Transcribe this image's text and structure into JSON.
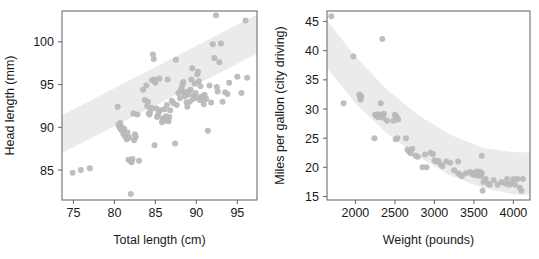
{
  "figure": {
    "background": "#ffffff",
    "point_color": "#b9b9b9",
    "band_color": "#ebebeb",
    "axis_color": "#6e6e6e",
    "text_color": "#1a1a1a"
  },
  "chart_data": [
    {
      "type": "scatter",
      "panel": "left",
      "title": "",
      "xlabel": "Total length (cm)",
      "ylabel": "Head length (mm)",
      "xlim": [
        73.6,
        97.4
      ],
      "ylim": [
        81.5,
        103.6
      ],
      "xticks": [
        75,
        80,
        85,
        90,
        95
      ],
      "yticks": [
        85,
        90,
        95,
        100
      ],
      "xticklabels": [
        "75",
        "80",
        "85",
        "90",
        "95"
      ],
      "yticklabels": [
        "85",
        "90",
        "95",
        "100"
      ],
      "grid": false,
      "legend": "none",
      "annotations": [
        "shaded prediction band rising left-to-right"
      ],
      "band": {
        "kind": "linear-prediction-band",
        "lower": [
          [
            73.6,
            87.0
          ],
          [
            97.4,
            98.6
          ]
        ],
        "upper": [
          [
            73.6,
            91.4
          ],
          [
            97.4,
            103.2
          ]
        ]
      },
      "x": [
        74.9,
        75.9,
        77.0,
        80.4,
        80.5,
        80.6,
        80.7,
        80.7,
        80.8,
        80.9,
        81.0,
        81.1,
        81.2,
        81.3,
        81.4,
        81.5,
        81.6,
        81.8,
        82.0,
        82.1,
        82.2,
        82.4,
        82.5,
        82.6,
        82.8,
        83.0,
        83.5,
        83.7,
        83.9,
        84.0,
        84.1,
        84.2,
        84.3,
        84.4,
        84.5,
        84.6,
        84.7,
        84.8,
        84.9,
        85.0,
        85.1,
        85.2,
        85.3,
        85.4,
        85.5,
        85.6,
        85.8,
        85.9,
        86.0,
        86.1,
        86.2,
        86.3,
        86.4,
        86.5,
        86.6,
        86.7,
        86.8,
        87.0,
        87.2,
        87.4,
        87.6,
        87.8,
        88.0,
        88.1,
        88.2,
        88.3,
        88.4,
        88.5,
        88.6,
        88.7,
        88.8,
        88.9,
        89.0,
        89.1,
        89.2,
        89.3,
        89.4,
        89.5,
        89.6,
        89.7,
        89.8,
        89.9,
        90.0,
        90.1,
        90.2,
        90.3,
        90.4,
        90.5,
        90.6,
        90.7,
        90.8,
        90.9,
        91.0,
        91.2,
        91.4,
        91.6,
        91.8,
        92.0,
        92.2,
        92.4,
        92.5,
        92.6,
        92.8,
        93.0,
        93.2,
        93.5,
        93.8,
        94.0,
        95.0,
        95.5,
        96.0,
        96.2,
        82.0,
        82.3,
        81.7,
        86.5,
        87.5,
        84.9
      ],
      "y": [
        84.7,
        85.0,
        85.2,
        92.4,
        90.3,
        90.1,
        89.9,
        90.5,
        89.7,
        90.0,
        89.6,
        89.2,
        89.8,
        89.0,
        88.9,
        88.6,
        89.4,
        88.8,
        86.0,
        85.9,
        86.3,
        88.5,
        89.2,
        88.9,
        91.5,
        86.1,
        94.4,
        93.2,
        94.9,
        92.5,
        93.0,
        91.6,
        91.5,
        91.9,
        92.3,
        95.5,
        98.5,
        98.0,
        95.6,
        95.2,
        92.2,
        91.2,
        91.4,
        91.8,
        95.7,
        92.0,
        90.6,
        90.9,
        91.1,
        92.1,
        90.8,
        91.3,
        92.6,
        91.0,
        90.7,
        91.2,
        92.0,
        93.1,
        92.8,
        88.1,
        92.6,
        94.0,
        93.4,
        94.3,
        94.6,
        95.0,
        95.3,
        93.9,
        93.6,
        94.1,
        92.9,
        92.4,
        93.8,
        94.2,
        93.0,
        94.4,
        95.6,
        96.9,
        93.3,
        93.7,
        95.1,
        94.0,
        93.5,
        96.2,
        96.5,
        95.4,
        93.2,
        94.8,
        93.6,
        93.4,
        93.1,
        92.7,
        93.8,
        93.3,
        89.6,
        94.9,
        92.9,
        99.7,
        98.1,
        103.1,
        94.7,
        94.2,
        97.6,
        99.8,
        93.0,
        94.1,
        93.9,
        95.2,
        95.9,
        94.0,
        102.5,
        95.8,
        82.2,
        91.6,
        86.2,
        95.6,
        97.9,
        87.9
      ]
    },
    {
      "type": "scatter",
      "panel": "right",
      "title": "",
      "xlabel": "Weight (pounds)",
      "ylabel": "Miles per gallon (city driving)",
      "xlim": [
        1640,
        4210
      ],
      "ylim": [
        14.4,
        46.8
      ],
      "xticks": [
        2000,
        2500,
        3000,
        3500,
        4000
      ],
      "yticks": [
        15,
        20,
        25,
        30,
        35,
        40,
        45
      ],
      "xticklabels": [
        "2000",
        "2500",
        "3000",
        "3500",
        "4000"
      ],
      "yticklabels": [
        "15",
        "20",
        "25",
        "30",
        "35",
        "40",
        "45"
      ],
      "grid": false,
      "legend": "none",
      "annotations": [
        "shaded curved prediction band decreasing left-to-right"
      ],
      "band": {
        "kind": "curved-prediction-band",
        "lower": [
          [
            1640,
            37.0
          ],
          [
            2000,
            31.0
          ],
          [
            2400,
            25.8
          ],
          [
            2800,
            21.8
          ],
          [
            3200,
            18.6
          ],
          [
            3600,
            16.5
          ],
          [
            4000,
            15.4
          ],
          [
            4210,
            15.2
          ]
        ],
        "upper": [
          [
            1640,
            45.2
          ],
          [
            2000,
            39.0
          ],
          [
            2400,
            33.3
          ],
          [
            2800,
            28.9
          ],
          [
            3200,
            25.6
          ],
          [
            3600,
            23.4
          ],
          [
            4000,
            22.6
          ],
          [
            4210,
            22.6
          ]
        ]
      },
      "x": [
        1695,
        1850,
        1975,
        2050,
        2060,
        2065,
        2075,
        2240,
        2250,
        2265,
        2280,
        2290,
        2300,
        2320,
        2340,
        2350,
        2360,
        2400,
        2480,
        2500,
        2510,
        2520,
        2530,
        2540,
        2640,
        2660,
        2680,
        2700,
        2720,
        2760,
        2790,
        2850,
        2880,
        2900,
        2950,
        2980,
        3000,
        3020,
        3050,
        3080,
        3100,
        3150,
        3200,
        3250,
        3300,
        3320,
        3350,
        3400,
        3450,
        3480,
        3500,
        3510,
        3520,
        3530,
        3540,
        3550,
        3560,
        3570,
        3580,
        3590,
        3600,
        3610,
        3620,
        3650,
        3680,
        3700,
        3750,
        3800,
        3850,
        3900,
        3920,
        3950,
        3980,
        4000,
        4020,
        4050,
        4080,
        4100,
        4120,
        2350,
        2300,
        3300,
        3600
      ],
      "y": [
        45.9,
        31.0,
        39.0,
        32.5,
        32.0,
        31.6,
        32.2,
        25.0,
        29.0,
        28.8,
        29.1,
        28.6,
        29.0,
        31.0,
        42.0,
        28.5,
        29.2,
        28.0,
        28.0,
        29.0,
        24.8,
        28.7,
        25.0,
        28.2,
        25.0,
        23.0,
        22.7,
        22.4,
        23.2,
        22.0,
        21.8,
        20.0,
        22.2,
        20.0,
        22.5,
        22.3,
        21.2,
        21.0,
        21.1,
        20.5,
        20.2,
        21.0,
        20.8,
        19.5,
        19.0,
        18.8,
        18.5,
        19.0,
        19.2,
        18.8,
        19.0,
        18.7,
        19.1,
        18.9,
        19.3,
        18.6,
        19.0,
        18.8,
        19.2,
        18.5,
        22.0,
        16.0,
        17.5,
        18.0,
        17.2,
        17.0,
        17.8,
        17.0,
        17.5,
        17.2,
        18.0,
        17.0,
        17.3,
        18.0,
        17.0,
        18.0,
        16.5,
        16.0,
        18.0,
        28.9,
        28.9,
        21.0,
        19.0
      ]
    }
  ]
}
